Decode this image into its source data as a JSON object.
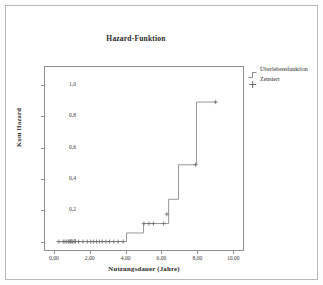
{
  "chart_data": {
    "type": "line",
    "title": "Hazard-Funktion",
    "xlabel": "Nutzungsdauer (Jahre)",
    "ylabel": "Kum Hazard",
    "xlim": [
      -0.55,
      10.6
    ],
    "ylim": [
      -0.06,
      1.12
    ],
    "xticks": [
      0,
      2,
      4,
      6,
      8,
      10
    ],
    "xticklabels": [
      "0,00",
      "2,00",
      "4,00",
      "6,00",
      "8,00",
      "10,00"
    ],
    "yticks": [
      0.0,
      0.2,
      0.4,
      0.6,
      0.8,
      1.0
    ],
    "yticklabels": [
      "0,0",
      "0,2",
      "0,4",
      "0,6",
      "0,8",
      "1,0"
    ],
    "grid": false,
    "legend_position": "right-top",
    "series": [
      {
        "name": "Überlebensfunktion",
        "style": "step",
        "color": "#8a8a8a",
        "x": [
          0.15,
          4.05,
          4.05,
          5.0,
          5.0,
          6.4,
          6.4,
          6.95,
          6.95,
          7.95,
          7.95,
          9.05
        ],
        "y": [
          0.0,
          0.0,
          0.055,
          0.055,
          0.115,
          0.115,
          0.27,
          0.27,
          0.49,
          0.49,
          0.89,
          0.89
        ]
      }
    ],
    "censored": {
      "name": "Zensiert",
      "marker": "+",
      "color": "#6f6f6f",
      "points": [
        {
          "x": 0.28,
          "y": 0.0
        },
        {
          "x": 0.52,
          "y": 0.0
        },
        {
          "x": 0.62,
          "y": 0.0
        },
        {
          "x": 0.72,
          "y": 0.0
        },
        {
          "x": 0.82,
          "y": 0.0
        },
        {
          "x": 0.92,
          "y": 0.0
        },
        {
          "x": 1.02,
          "y": 0.0
        },
        {
          "x": 1.18,
          "y": 0.0
        },
        {
          "x": 1.38,
          "y": 0.0
        },
        {
          "x": 1.62,
          "y": 0.0
        },
        {
          "x": 1.86,
          "y": 0.0
        },
        {
          "x": 2.06,
          "y": 0.0
        },
        {
          "x": 2.22,
          "y": 0.0
        },
        {
          "x": 2.38,
          "y": 0.0
        },
        {
          "x": 2.54,
          "y": 0.0
        },
        {
          "x": 2.7,
          "y": 0.0
        },
        {
          "x": 2.9,
          "y": 0.0
        },
        {
          "x": 3.1,
          "y": 0.0
        },
        {
          "x": 3.34,
          "y": 0.0
        },
        {
          "x": 3.58,
          "y": 0.0
        },
        {
          "x": 3.86,
          "y": 0.0
        },
        {
          "x": 5.02,
          "y": 0.115
        },
        {
          "x": 5.3,
          "y": 0.115
        },
        {
          "x": 5.55,
          "y": 0.115
        },
        {
          "x": 6.12,
          "y": 0.115
        },
        {
          "x": 6.3,
          "y": 0.175
        },
        {
          "x": 7.9,
          "y": 0.49
        },
        {
          "x": 9.02,
          "y": 0.89
        }
      ]
    },
    "legend": [
      {
        "label": "Überlebensfunktion",
        "symbol": "step-line"
      },
      {
        "label": "Zensiert",
        "symbol": "plus"
      }
    ]
  },
  "colors": {
    "axis": "#8f8f8f",
    "line": "#8a8a8a",
    "text": "#2a2a2a",
    "tick_text": "#3a3a3a",
    "outer_border": "#b9b9b9",
    "background": "#ffffff"
  }
}
